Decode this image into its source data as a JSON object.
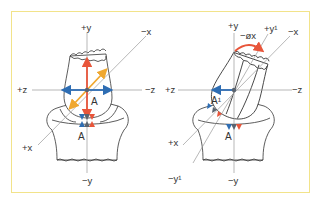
{
  "figure": {
    "frame_color": "#f2e38a",
    "colors": {
      "y_axis_arrow": "#e8553a",
      "z_axis_arrow": "#2e6db3",
      "x_axis_arrow": "#f0a830",
      "rotation_arrow": "#e8553a",
      "contact_blue": "#2e6db3",
      "contact_grey": "#5a6470",
      "contact_red": "#e8553a"
    },
    "left_panel": {
      "labels": {
        "pos_y": "+y",
        "neg_y": "−y",
        "pos_z": "+z",
        "neg_z": "−z",
        "pos_x": "+x",
        "neg_x": "−x",
        "point_upper": "A",
        "point_lower": "A"
      }
    },
    "right_panel": {
      "labels": {
        "pos_y": "+y",
        "neg_y": "−y",
        "pos_z": "+z",
        "neg_z": "−z",
        "pos_x": "+x",
        "neg_x": "−x",
        "pos_y1": "+y¹",
        "neg_y1": "−y¹",
        "rotation": "−øx",
        "point_upper": "A¹",
        "point_lower": "A"
      }
    }
  }
}
